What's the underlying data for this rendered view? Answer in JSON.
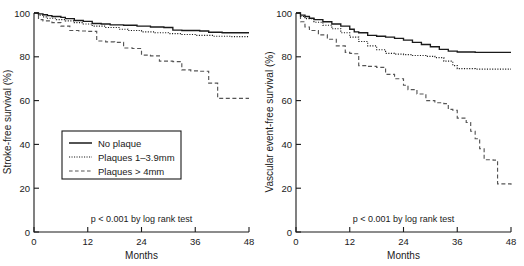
{
  "figure": {
    "type": "kaplan-meier-survival-figure",
    "panel_count": 2
  },
  "panels": [
    {
      "id": "left",
      "ylabel": "Stroke-free survival (%)",
      "xlabel": "Months",
      "pvalue_text": "p < 0.001 by log rank test",
      "yticks": [
        "0",
        "20",
        "40",
        "60",
        "80",
        "100"
      ],
      "xticks": [
        "0",
        "12",
        "24",
        "36",
        "48"
      ],
      "legend": {
        "visible": true,
        "items": [
          {
            "label": "No plaque",
            "style": "solid"
          },
          {
            "label": "Plaques 1–3.9mm",
            "style": "dotted"
          },
          {
            "label": "Plaques > 4mm",
            "style": "dashed"
          }
        ]
      }
    },
    {
      "id": "right",
      "ylabel": "Vascular event-free survival (%)",
      "xlabel": "Months",
      "pvalue_text": "p < 0.001 by log rank test",
      "yticks": [
        "0",
        "20",
        "40",
        "60",
        "80",
        "100"
      ],
      "xticks": [
        "0",
        "12",
        "24",
        "36",
        "48"
      ],
      "legend": {
        "visible": false,
        "items": []
      }
    }
  ],
  "chart_data": [
    {
      "type": "line",
      "panel": "left",
      "title": "",
      "xlabel": "Months",
      "ylabel": "Stroke-free survival (%)",
      "xlim": [
        0,
        48
      ],
      "ylim": [
        0,
        100
      ],
      "xticks": [
        0,
        12,
        24,
        36,
        48
      ],
      "yticks": [
        0,
        20,
        40,
        60,
        80,
        100
      ],
      "grid": false,
      "legend_position": "center-left",
      "annotations": [
        "p < 0.001 by log rank test"
      ],
      "step": "post",
      "series": [
        {
          "name": "No plaque",
          "style": "solid",
          "color": "#1a1a1a",
          "x": [
            0,
            1,
            2,
            3,
            4,
            6,
            7,
            9,
            11,
            13,
            15,
            17,
            20,
            23,
            26,
            29,
            31,
            33,
            37,
            39,
            42,
            48
          ],
          "y": [
            100,
            99.6,
            99.2,
            98.8,
            98.4,
            98.0,
            97.4,
            96.6,
            96.2,
            95.2,
            95.0,
            94.6,
            94.4,
            94.0,
            93.6,
            93.4,
            92.2,
            92.0,
            91.8,
            91.2,
            91.0,
            91.0
          ]
        },
        {
          "name": "Plaques 1–3.9mm",
          "style": "dotted",
          "color": "#1a1a1a",
          "x": [
            0,
            1,
            2,
            3,
            5,
            7,
            9,
            11,
            13,
            16,
            19,
            21,
            24,
            27,
            30,
            33,
            36,
            40,
            44,
            48
          ],
          "y": [
            100,
            99.0,
            98.2,
            97.6,
            97.0,
            96.4,
            95.6,
            95.0,
            94.0,
            93.4,
            92.6,
            92.0,
            91.4,
            91.0,
            90.6,
            90.2,
            89.8,
            89.4,
            89.2,
            89.2
          ]
        },
        {
          "name": "Plaques > 4mm",
          "style": "dashed",
          "color": "#555555",
          "x": [
            0,
            1,
            2,
            4,
            6,
            8,
            10,
            12,
            14,
            16,
            18,
            20,
            22,
            24,
            26,
            28,
            31,
            33,
            35,
            37,
            39,
            41,
            48
          ],
          "y": [
            100,
            97.0,
            96.4,
            95.6,
            94.0,
            92.0,
            91.8,
            91.6,
            87.2,
            86.8,
            86.6,
            84.0,
            83.8,
            80.8,
            80.4,
            78.0,
            77.8,
            74.0,
            73.6,
            73.4,
            68.0,
            61.0,
            61.0
          ]
        }
      ]
    },
    {
      "type": "line",
      "panel": "right",
      "title": "",
      "xlabel": "Months",
      "ylabel": "Vascular event-free survival (%)",
      "xlim": [
        0,
        48
      ],
      "ylim": [
        0,
        100
      ],
      "xticks": [
        0,
        12,
        24,
        36,
        48
      ],
      "yticks": [
        0,
        20,
        40,
        60,
        80,
        100
      ],
      "grid": false,
      "legend_position": "none",
      "annotations": [
        "p < 0.001 by log rank test"
      ],
      "step": "post",
      "series": [
        {
          "name": "No plaque",
          "style": "solid",
          "color": "#1a1a1a",
          "x": [
            0,
            1,
            2,
            3,
            4,
            6,
            8,
            10,
            12,
            13,
            14,
            16,
            18,
            20,
            22,
            24,
            26,
            28,
            30,
            32,
            34,
            36,
            40,
            44,
            48
          ],
          "y": [
            100,
            99.0,
            98.4,
            97.6,
            97.0,
            96.0,
            95.0,
            94.0,
            92.6,
            91.4,
            91.0,
            89.8,
            89.4,
            89.0,
            88.4,
            87.6,
            86.6,
            85.6,
            84.6,
            83.4,
            82.6,
            82.2,
            82.0,
            82.0,
            82.0
          ]
        },
        {
          "name": "Plaques 1–3.9mm",
          "style": "dotted",
          "color": "#1a1a1a",
          "x": [
            0,
            1,
            2,
            4,
            6,
            8,
            10,
            12,
            14,
            16,
            18,
            20,
            22,
            24,
            26,
            29,
            31,
            33,
            35,
            36,
            40,
            44,
            48
          ],
          "y": [
            100,
            98.4,
            97.4,
            95.8,
            94.4,
            92.8,
            91.0,
            89.0,
            87.0,
            85.0,
            83.2,
            81.6,
            81.2,
            81.0,
            80.6,
            80.2,
            79.6,
            78.0,
            76.0,
            74.6,
            74.4,
            74.4,
            74.4
          ]
        },
        {
          "name": "Plaques > 4mm",
          "style": "dashed",
          "color": "#555555",
          "x": [
            0,
            1,
            2,
            3,
            5,
            7,
            9,
            11,
            12,
            13,
            14,
            16,
            18,
            20,
            22,
            24,
            25,
            27,
            29,
            31,
            33,
            34,
            35,
            36,
            38,
            39,
            40,
            41,
            42,
            44,
            45,
            48
          ],
          "y": [
            100,
            96.0,
            93.6,
            92.0,
            90.0,
            88.0,
            85.0,
            82.0,
            81.6,
            81.4,
            76.0,
            75.6,
            75.2,
            72.0,
            70.0,
            67.0,
            65.0,
            63.0,
            60.0,
            59.0,
            58.6,
            56.0,
            55.6,
            52.0,
            50.0,
            46.0,
            42.6,
            38.0,
            33.0,
            32.8,
            22.0,
            21.6
          ]
        }
      ]
    }
  ]
}
